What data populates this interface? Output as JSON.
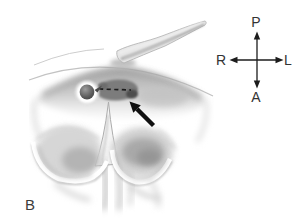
{
  "figure": {
    "panel_label": "B",
    "compass": {
      "top": "P",
      "bottom": "A",
      "left": "R",
      "right": "L"
    },
    "icons": {
      "compass": "four-way-orientation-arrows",
      "annotation_arrow": "black-arrow-pointing-upper-left",
      "incision_line": "black-dashed-line",
      "tube": "curved-endoscope-tube",
      "knob": "round-dark-knob"
    },
    "colors": {
      "background": "#ffffff",
      "ink": "#1c1c1c",
      "label_text": "#333333",
      "pencil_light": "#d6d6d6",
      "pencil_mid": "#aaaaaa",
      "fenestration_dark": "#7c7c7c",
      "knob_dark": "#4a4a4a"
    }
  }
}
